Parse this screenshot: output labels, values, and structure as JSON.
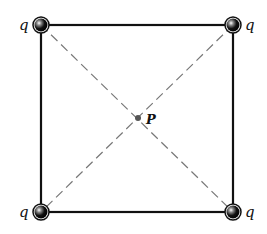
{
  "diagram": {
    "charges": [
      {
        "label": "q",
        "position": "top-left"
      },
      {
        "label": "q",
        "position": "top-right"
      },
      {
        "label": "q",
        "position": "bottom-left"
      },
      {
        "label": "q",
        "position": "bottom-right"
      }
    ],
    "center_point": {
      "label": "P"
    },
    "colors": {
      "lines": "#111111",
      "diagonals": "#777777",
      "charge": "#111111"
    }
  }
}
